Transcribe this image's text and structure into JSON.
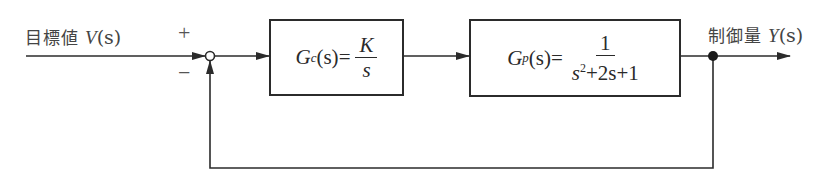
{
  "input": {
    "label_jp": "目標値",
    "symbol": "V",
    "arg": "(s)"
  },
  "output": {
    "label_jp": "制御量",
    "symbol": "Y",
    "arg": "(s)"
  },
  "summing_junction": {
    "plus": "+",
    "minus": "−"
  },
  "blocks": [
    {
      "id": "controller",
      "name": "G",
      "subscript": "c",
      "arg": "(s)",
      "equals": "=",
      "numerator": "K",
      "denominator": "s"
    },
    {
      "id": "plant",
      "name": "G",
      "subscript": "p",
      "arg": "(s)",
      "equals": "=",
      "numerator": "1",
      "denominator_parts": {
        "s": "s",
        "exp": "2",
        "rest": "+2s+1"
      }
    }
  ],
  "colors": {
    "line": "#2b2b2b",
    "text": "#444444",
    "background": "#ffffff"
  }
}
